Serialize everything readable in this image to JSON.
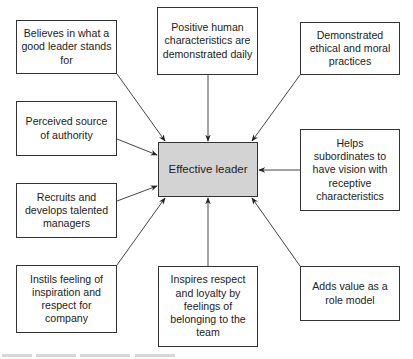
{
  "diagram": {
    "center": {
      "label": "Effective leader",
      "fill": "#d3d3d3"
    },
    "nodes": [
      {
        "id": "tl",
        "label": "Believes in what a good leader stands for"
      },
      {
        "id": "tc",
        "label": "Positive human characteristics are demonstrated daily"
      },
      {
        "id": "tr",
        "label": "Demonstrated ethical and moral practices"
      },
      {
        "id": "ml",
        "label": "Perceived source of authority"
      },
      {
        "id": "mr",
        "label": "Helps subordinates to have vision with receptive characteristics"
      },
      {
        "id": "l2",
        "label": "Recruits and develops talented managers"
      },
      {
        "id": "bl",
        "label": "Instils feeling of inspiration and respect for company"
      },
      {
        "id": "bc",
        "label": "Inspires respect and loyalty by feelings of belonging to the team"
      },
      {
        "id": "br",
        "label": "Adds value as a role model"
      }
    ],
    "edges": [
      {
        "from": "tl",
        "to": "center"
      },
      {
        "from": "tc",
        "to": "center"
      },
      {
        "from": "tr",
        "to": "center"
      },
      {
        "from": "ml",
        "to": "center"
      },
      {
        "from": "mr",
        "to": "center"
      },
      {
        "from": "l2",
        "to": "center"
      },
      {
        "from": "bl",
        "to": "center"
      },
      {
        "from": "bc",
        "to": "center"
      },
      {
        "from": "br",
        "to": "center"
      }
    ],
    "line_color": "#333333"
  }
}
